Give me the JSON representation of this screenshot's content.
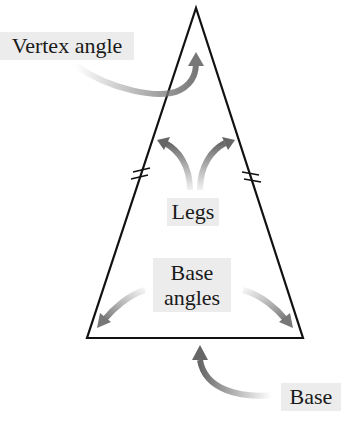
{
  "diagram": {
    "labels": {
      "vertex_angle": "Vertex angle",
      "legs": "Legs",
      "base_angles_line1": "Base",
      "base_angles_line2": "angles",
      "base": "Base"
    },
    "triangle": {
      "apex": [
        196,
        8
      ],
      "base_left": [
        87,
        338
      ],
      "base_right": [
        303,
        338
      ]
    },
    "colors": {
      "line": "#111111",
      "arrow": "#777777",
      "label_bg": "#ececec"
    }
  }
}
